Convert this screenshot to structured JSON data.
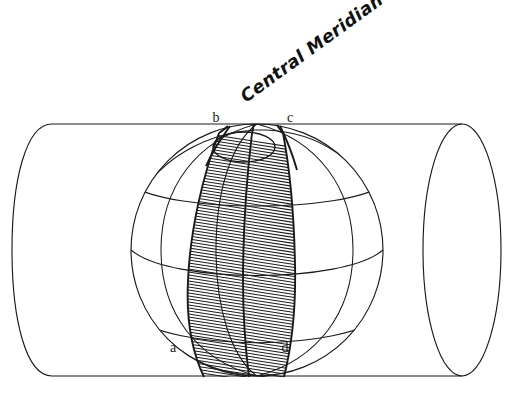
{
  "figure": {
    "kind": "geometry-diagram",
    "background_color": "#ffffff",
    "ink_color": "#1a1a1a"
  },
  "labels": {
    "title": "Central Meridian",
    "title_rotation_deg": -36,
    "point_b": "b",
    "point_c": "c",
    "point_a": "a",
    "point_d": "d"
  },
  "geometry": {
    "cylinder": {
      "axis_y": 250,
      "top_tangent_y": 124,
      "bottom_tangent_y": 376,
      "left_end_center_x": 52,
      "right_end_center_x": 462,
      "end_rx": 40,
      "end_ry": 126
    },
    "sphere": {
      "center_x": 257,
      "center_y": 250,
      "radius": 126
    },
    "gore": {
      "top_label_left": "b",
      "top_label_right": "c",
      "bottom_label_left": "a",
      "bottom_label_right": "d",
      "hatch_spacing_px": 3.1,
      "hatch_slope": 0.16
    },
    "polar_circle": {
      "center_x": 244,
      "center_y": 147,
      "rx": 31,
      "ry": 15
    }
  }
}
